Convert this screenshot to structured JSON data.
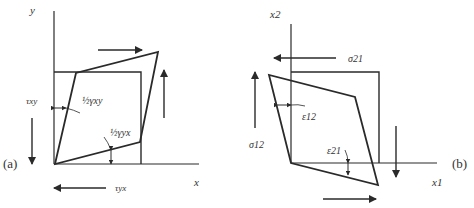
{
  "panel_a": {
    "tag": "(a)",
    "axis_x": "x",
    "axis_y": "y",
    "stress_xy": "τxy",
    "stress_yx": "τyx",
    "strain_xy": "½γxy",
    "strain_yx": "½γyx"
  },
  "panel_b": {
    "tag": "(b)",
    "axis_x": "x1",
    "axis_y": "x2",
    "stress_12": "σ12",
    "stress_21": "σ21",
    "strain_12": "ε12",
    "strain_21": "ε21"
  },
  "colors": {
    "line": "#2a2a2a",
    "background": "#ffffff"
  }
}
